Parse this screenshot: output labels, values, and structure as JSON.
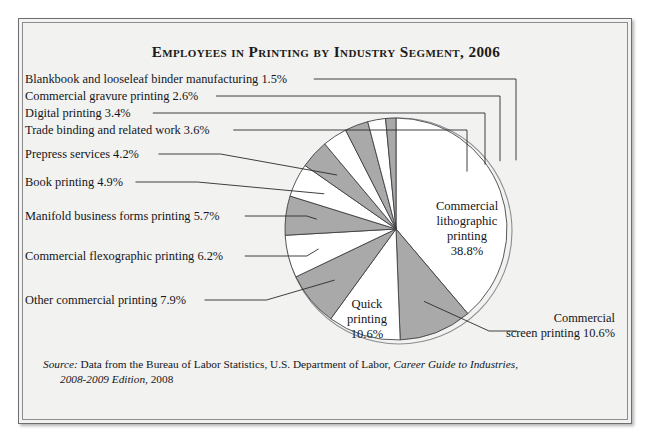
{
  "title": "Employees in Printing by Industry Segment, 2006",
  "source": {
    "label": "Source:",
    "text1": " Data from the Bureau of Labor Statistics, U.S. Department of Labor, ",
    "italic1": "Career Guide to Industries,",
    "italic2": "2008-2009 Edition",
    "text2": ", 2008"
  },
  "chart_data": {
    "type": "pie",
    "title": "Employees in Printing by Industry Segment, 2006",
    "unit": "percent",
    "start_angle_deg": 0,
    "direction": "clockwise",
    "categories": [
      "Commercial lithographic printing",
      "Commercial screen printing",
      "Quick printing",
      "Other commercial printing",
      "Commercial flexographic printing",
      "Manifold business forms printing",
      "Book printing",
      "Prepress services",
      "Trade binding and related work",
      "Digital printing",
      "Commercial gravure printing",
      "Blankbook and looseleaf binder manufacturing"
    ],
    "values": [
      38.8,
      10.6,
      10.6,
      7.9,
      6.2,
      5.7,
      4.9,
      4.2,
      3.6,
      3.4,
      2.6,
      1.5
    ],
    "slice_fills": [
      "#ffffff",
      "#a9a9a9",
      "#ffffff",
      "#a9a9a9",
      "#ffffff",
      "#a9a9a9",
      "#ffffff",
      "#a9a9a9",
      "#ffffff",
      "#a9a9a9",
      "#ffffff",
      "#a9a9a9"
    ],
    "legend": "none (direct labels with leader lines)"
  },
  "inside_labels": [
    {
      "name": "commercial-lithographic",
      "lines": [
        "Commercial",
        "lithographic",
        "printing",
        "38.8%"
      ]
    },
    {
      "name": "quick-printing",
      "lines": [
        "Quick",
        "printing",
        "10.6%"
      ]
    }
  ],
  "left_labels": [
    {
      "name": "blankbook",
      "text": "Blankbook and looseleaf binder manufacturing 1.5%"
    },
    {
      "name": "commercial-gravure",
      "text": "Commercial gravure printing 2.6%"
    },
    {
      "name": "digital-printing",
      "text": "Digital printing 3.4%"
    },
    {
      "name": "trade-binding",
      "text": "Trade binding and related work 3.6%"
    },
    {
      "name": "prepress-services",
      "text": "Prepress services 4.2%"
    },
    {
      "name": "book-printing",
      "text": "Book printing 4.9%"
    },
    {
      "name": "manifold-business-forms",
      "text": "Manifold business forms printing 5.7%"
    },
    {
      "name": "commercial-flexographic",
      "text": "Commercial flexographic printing 6.2%"
    },
    {
      "name": "other-commercial",
      "text": "Other commercial printing 7.9%"
    }
  ],
  "right_label": {
    "name": "commercial-screen-printing",
    "lines": [
      "Commercial",
      "screen printing 10.6%"
    ]
  },
  "colors": {
    "page_bg": "#f2f2f0",
    "slice_gray": "#a9a9a9",
    "slice_white": "#ffffff",
    "outline": "#3a3a3e",
    "text": "#15151a"
  }
}
